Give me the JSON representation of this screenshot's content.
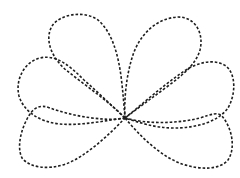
{
  "figure": {
    "description": "Dashed outline drawing of a six-petal flower shape with all petals meeting at a central point",
    "stroke_color": "#1e1e1e",
    "background_color": "#ffffff",
    "line_style": "dashed",
    "center": {
      "x": 125,
      "y": 118
    },
    "petals": [
      {
        "name": "upper-left",
        "path": "M125,118 C112,104 86,86 66,70 C52,58 44,40 52,26 C60,14 84,10 98,20 C112,32 118,54 121,76 C123,92 124,106 125,118 Z"
      },
      {
        "name": "upper-right",
        "path": "M125,118 C124,100 126,74 134,52 C142,32 158,18 178,17 C196,17 204,34 200,50 C196,64 184,74 168,86 C152,98 138,108 125,118 Z"
      },
      {
        "name": "middle-left",
        "path": "M125,118 C108,120 82,126 60,124 C40,122 24,112 19,96 C15,80 24,62 40,58 C56,54 70,66 84,80 C100,94 114,108 125,118 Z"
      },
      {
        "name": "middle-right",
        "path": "M125,118 C140,106 160,88 180,74 C196,62 214,58 226,66 C236,74 236,94 228,108 C218,122 196,128 174,128 C154,128 138,122 125,118 Z"
      },
      {
        "name": "lower-left",
        "path": "M125,118 C106,122 72,116 50,108 C40,104 34,108 30,114 C22,126 16,146 22,158 C30,168 48,170 66,164 C86,156 108,136 125,118 Z"
      },
      {
        "name": "lower-right",
        "path": "M125,118 C146,124 176,124 200,118 C212,114 218,112 222,116 C232,128 236,148 228,160 C220,170 200,170 182,164 C160,156 140,136 125,118 Z"
      }
    ]
  }
}
